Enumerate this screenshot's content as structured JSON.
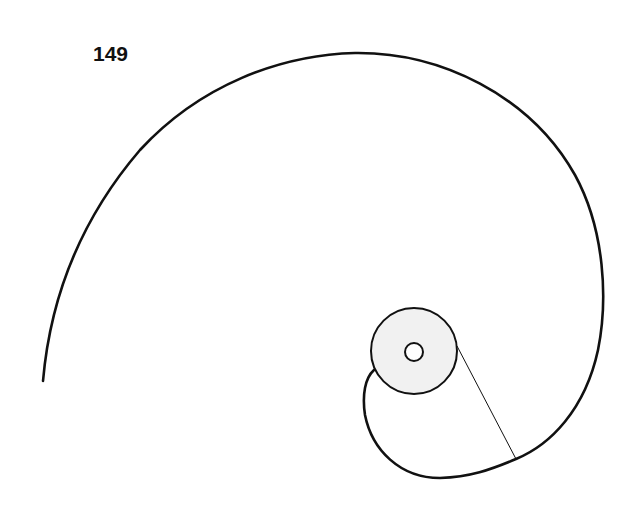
{
  "page": {
    "number": "149"
  },
  "figure": {
    "colors": {
      "stroke": "#111111",
      "disc_fill": "#f1f1f1",
      "background": "#ffffff"
    },
    "disc": {
      "cx": 414,
      "cy": 351,
      "r": 43
    },
    "hole": {
      "cx": 414,
      "cy": 352,
      "r": 9
    },
    "tangent_line": {
      "x1": 457,
      "y1": 346,
      "x2": 516,
      "y2": 459
    },
    "spiral_outer_end": {
      "x": 43,
      "y": 381
    },
    "spiral_inner_end": {
      "x": 374,
      "y": 370
    }
  }
}
